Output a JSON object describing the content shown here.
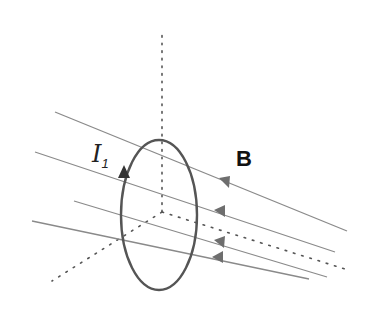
{
  "diagram": {
    "type": "physics-illustration",
    "labels": {
      "current": "I",
      "current_subscript": "1",
      "field": "B"
    },
    "colors": {
      "background": "#ffffff",
      "field_lines": "#8a8a8a",
      "loop": "#555555",
      "axes": "#555555",
      "text": "#222222"
    },
    "axes": {
      "origin": [
        162,
        212
      ],
      "vertical": {
        "from": [
          162,
          212
        ],
        "to": [
          162,
          30
        ],
        "style": "dotted"
      },
      "right": {
        "from": [
          162,
          212
        ],
        "to": [
          345,
          269
        ],
        "style": "dotted"
      },
      "left": {
        "from": [
          162,
          212
        ],
        "to": [
          52,
          281
        ],
        "style": "dotted"
      }
    },
    "loop": {
      "center": [
        159,
        215
      ],
      "rx": 38,
      "ry": 75,
      "current_arrow": {
        "at": [
          124,
          172
        ],
        "direction": "up"
      }
    },
    "field_lines": [
      {
        "from": [
          347,
          231
        ],
        "to": [
          55,
          112
        ],
        "arrow_at": [
          227,
          182
        ]
      },
      {
        "from": [
          335,
          252
        ],
        "to": [
          35,
          152
        ],
        "arrow_at": [
          222,
          213
        ]
      },
      {
        "from": [
          327,
          277
        ],
        "to": [
          74,
          201
        ],
        "arrow_at": [
          222,
          243
        ]
      },
      {
        "from": [
          309,
          279
        ],
        "to": [
          32,
          221
        ],
        "arrow_at": [
          220,
          259
        ]
      }
    ]
  }
}
